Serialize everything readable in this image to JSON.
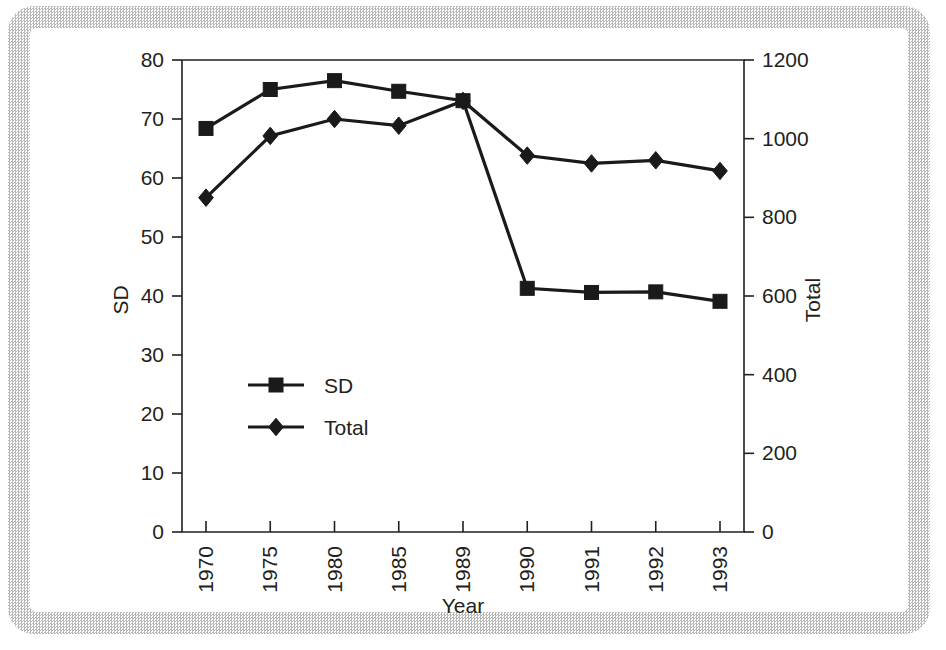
{
  "chart_data": {
    "type": "line",
    "title": "",
    "xlabel": "Year",
    "ylabel": "SD",
    "y2label": "Total",
    "categories": [
      "1970",
      "1975",
      "1980",
      "1985",
      "1989",
      "1990",
      "1991",
      "1992",
      "1993"
    ],
    "ylim": [
      0,
      80
    ],
    "yticks": [
      "0",
      "10",
      "20",
      "30",
      "40",
      "50",
      "60",
      "70",
      "80"
    ],
    "y2lim": [
      0,
      1200
    ],
    "y2ticks": [
      "0",
      "200",
      "400",
      "600",
      "800",
      "1000",
      "1200"
    ],
    "grid": false,
    "legend_position": "center-left-inside",
    "series": [
      {
        "name": "SD",
        "axis": "left",
        "marker": "square",
        "values": [
          68.4,
          75.0,
          76.5,
          74.7,
          73.1,
          41.3,
          40.6,
          40.7,
          39.1
        ]
      },
      {
        "name": "Total",
        "axis": "right",
        "marker": "diamond",
        "values": [
          850,
          1007,
          1050,
          1033,
          1096,
          957,
          937,
          945,
          918
        ],
        "values_left_scale": [
          56.7,
          67.1,
          70.0,
          68.9,
          73.1,
          63.8,
          62.5,
          63.0,
          61.2
        ]
      }
    ]
  },
  "legend": {
    "entries": [
      {
        "label": "SD",
        "marker": "square-marker-icon"
      },
      {
        "label": "Total",
        "marker": "diamond-marker-icon"
      }
    ]
  },
  "axes": {
    "left_title": "SD",
    "right_title": "Total",
    "bottom_title": "Year"
  },
  "colors": {
    "ink": "#231f20",
    "series": "#1a1a1a",
    "frame": "#b9b9b9",
    "background": "#ffffff"
  }
}
